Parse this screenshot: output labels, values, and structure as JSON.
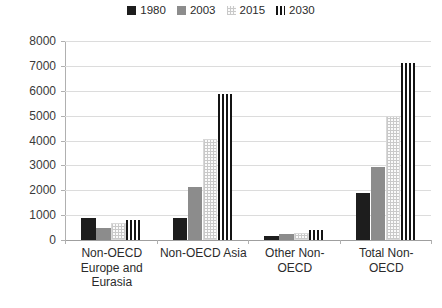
{
  "chart_data": {
    "type": "bar",
    "title": "",
    "subtitle": "",
    "xlabel": "",
    "ylabel": "",
    "ylim": [
      0,
      8000
    ],
    "ytick_values": [
      0,
      1000,
      2000,
      3000,
      4000,
      5000,
      6000,
      7000,
      8000
    ],
    "ytick_labels": [
      "0",
      "1000",
      "2000",
      "3000",
      "4000",
      "5000",
      "6000",
      "7000",
      "8000"
    ],
    "grid": true,
    "legend_position": "top-center",
    "categories": [
      "Non-OECD Europe and Eurasia",
      "Non-OECD Asia",
      "Other Non-OECD",
      "Total Non-OECD"
    ],
    "series": [
      {
        "name": "1980",
        "pattern": "solid-black",
        "color": "#1d1d1d",
        "values": [
          900,
          900,
          150,
          1900
        ]
      },
      {
        "name": "2003",
        "pattern": "solid-gray",
        "color": "#8c8c8c",
        "values": [
          500,
          2150,
          250,
          2950
        ]
      },
      {
        "name": "2015",
        "pattern": "light-checker",
        "color": "#fbfbfb",
        "values": [
          700,
          4050,
          300,
          5000
        ]
      },
      {
        "name": "2030",
        "pattern": "vertical-stripes",
        "color": "#141414",
        "values": [
          800,
          5850,
          400,
          7100
        ]
      }
    ]
  },
  "legend": {
    "entries": [
      {
        "label": "1980",
        "swatch": "legend-swatch-1980"
      },
      {
        "label": "2003",
        "swatch": "legend-swatch-2003"
      },
      {
        "label": "2015",
        "swatch": "legend-swatch-2015"
      },
      {
        "label": "2030",
        "swatch": "legend-swatch-2030"
      }
    ]
  }
}
